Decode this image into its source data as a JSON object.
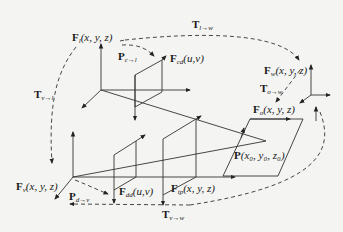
{
  "diagram": {
    "type": "coordinate-frame-transformation-diagram",
    "frames": {
      "lidar": {
        "symbol": "F",
        "subscript": "l",
        "args": "(x, y, z)"
      },
      "camera_image": {
        "symbol": "F",
        "subscript": "cd",
        "args": "(u,v)"
      },
      "world": {
        "symbol": "F",
        "subscript": "w",
        "args": "(x, y, z)"
      },
      "object": {
        "symbol": "F",
        "subscript": "o",
        "args": "(x, y, z)"
      },
      "vehicle": {
        "symbol": "F",
        "subscript": "v",
        "args": "(x, y, z)"
      },
      "image_dd": {
        "symbol": "F",
        "subscript": "dd",
        "args": "(u,v)"
      },
      "projection": {
        "symbol": "F",
        "subscript": "tp",
        "args": "(x, y, z)"
      }
    },
    "point": {
      "symbol": "P",
      "args": "(x₀, y₀, z₀)"
    },
    "transforms": {
      "T_l_w": {
        "symbol": "T",
        "subscript": "l→w"
      },
      "T_v_l": {
        "symbol": "T",
        "subscript": "v→l"
      },
      "T_o_w": {
        "symbol": "T",
        "subscript": "o→w"
      },
      "T_v_w": {
        "symbol": "T",
        "subscript": "v→w"
      },
      "P_c_l": {
        "symbol": "P",
        "subscript": "c→l"
      },
      "P_d_v": {
        "symbol": "P",
        "subscript": "d→v"
      }
    },
    "colors": {
      "line": "#333333",
      "background": "#f4f4f2"
    }
  }
}
